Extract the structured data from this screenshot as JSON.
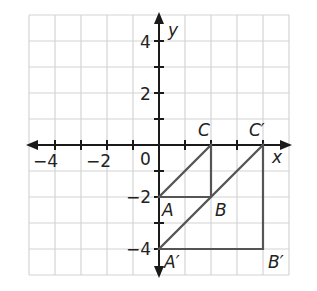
{
  "axes": {
    "x_label": "x",
    "y_label": "y",
    "x_ticks": [
      {
        "value": -4,
        "label": "−4"
      },
      {
        "value": -2,
        "label": "−2"
      }
    ],
    "y_ticks": [
      {
        "value": 4,
        "label": "4"
      },
      {
        "value": 2,
        "label": "2"
      },
      {
        "value": -2,
        "label": "−2"
      },
      {
        "value": -4,
        "label": "−4"
      }
    ],
    "origin_label": "0",
    "range": {
      "xmin": -5,
      "xmax": 5,
      "ymin": -5,
      "ymax": 5
    }
  },
  "points": {
    "A": {
      "label": "A",
      "x": 0,
      "y": -2
    },
    "B": {
      "label": "B",
      "x": 2,
      "y": -2
    },
    "C": {
      "label": "C",
      "x": 2,
      "y": 0
    },
    "A_prime": {
      "label": "A′",
      "x": 0,
      "y": -4
    },
    "B_prime": {
      "label": "B′",
      "x": 4,
      "y": -4
    },
    "C_prime": {
      "label": "C′",
      "x": 4,
      "y": 0
    }
  },
  "shapes": {
    "triangle_ABC": [
      "A",
      "B",
      "C"
    ],
    "triangle_A_prime_B_prime_C_prime": [
      "A_prime",
      "B_prime",
      "C_prime"
    ]
  },
  "colors": {
    "grid": "#d4d4d4",
    "axis": "#1a1a1a",
    "shape": "#555555"
  }
}
